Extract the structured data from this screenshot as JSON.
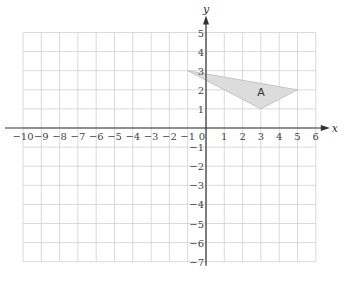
{
  "chart_data": {
    "type": "coordinate-grid",
    "title": "",
    "xlabel": "x",
    "ylabel": "y",
    "xlim": [
      -10,
      6
    ],
    "ylim": [
      -7,
      5
    ],
    "grid": true,
    "x_ticks": [
      "-10",
      "-9",
      "-8",
      "-7",
      "-6",
      "-5",
      "-4",
      "-3",
      "-2",
      "-1",
      "0",
      "1",
      "2",
      "3",
      "4",
      "5",
      "6"
    ],
    "y_ticks": [
      "5",
      "4",
      "3",
      "2",
      "1",
      "-1",
      "-2",
      "-3",
      "-4",
      "-5",
      "-6",
      "-7"
    ],
    "shapes": [
      {
        "label": "A",
        "type": "triangle",
        "vertices": [
          [
            -1,
            3
          ],
          [
            5,
            2
          ],
          [
            3,
            1
          ]
        ],
        "label_position": [
          2.8,
          1.9
        ],
        "fill": "#dcdcdc",
        "stroke": "#bbbbbb"
      }
    ]
  },
  "colors": {
    "grid": "#d0d0d0",
    "axis": "#333333",
    "shape_fill": "#dcdcdc"
  }
}
